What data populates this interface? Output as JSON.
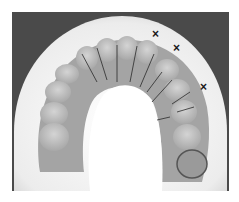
{
  "image": {
    "subject": "maxillary dental cast",
    "description": "Grayscale photograph of an upper-arch dental stone model on a white base with sectioned teeth and three X markings",
    "colors": {
      "background": "#4a4a4a",
      "base": "#f2f2f2",
      "teeth": "#bdbdbd",
      "gingiva": "#9e9e9e",
      "palate": "#ffffff",
      "markers": "#1a1a1a"
    },
    "markers": [
      {
        "label": "X",
        "x": 152,
        "y": 32
      },
      {
        "label": "X",
        "x": 173,
        "y": 46
      },
      {
        "label": "X",
        "x": 200,
        "y": 85
      }
    ]
  }
}
